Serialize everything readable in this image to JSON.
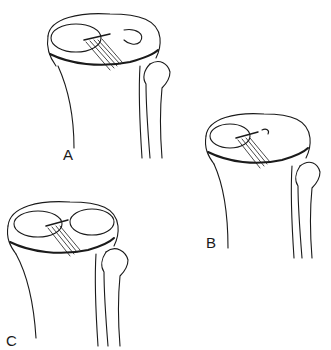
{
  "figures": [
    {
      "id": "A",
      "label": "A",
      "description": "Tibial plateau with medial and lateral menisci, anterior cruciate ligament, and fibular head"
    },
    {
      "id": "B",
      "label": "B",
      "description": "Tibial plateau with menisci variant, ligament, and fibular head"
    },
    {
      "id": "C",
      "label": "C",
      "description": "Tibial plateau with ring-shaped menisci, ligament, and fibular head"
    }
  ],
  "colors": {
    "ink": "#1a1a1a",
    "background": "#ffffff"
  }
}
